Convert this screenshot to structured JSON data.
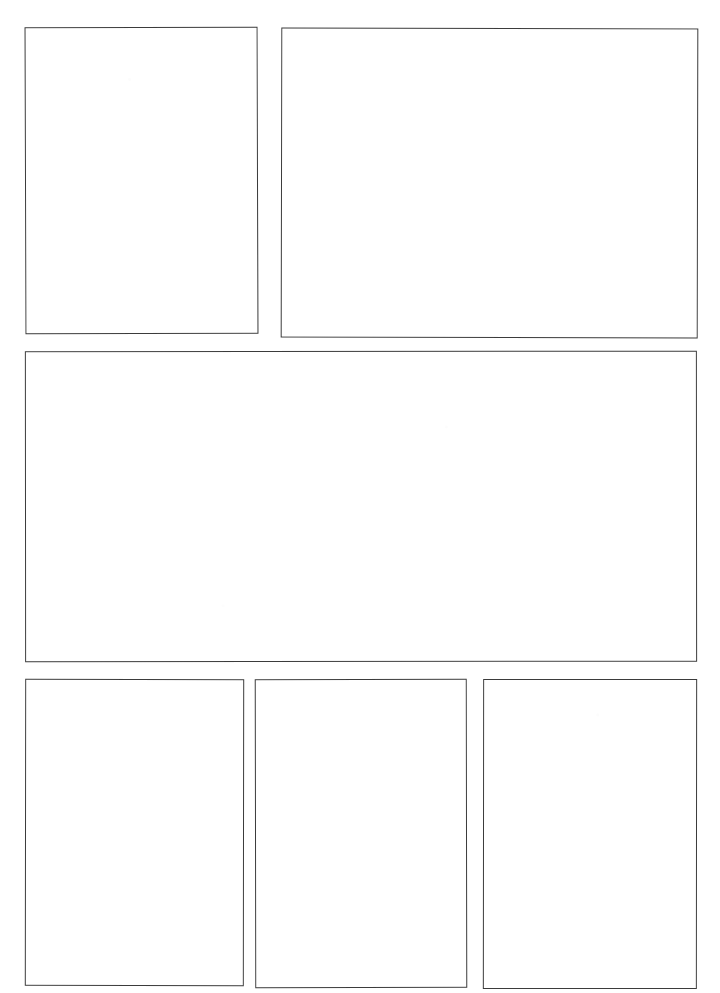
{
  "page": {
    "kind": "comic-page-layout",
    "width": 720,
    "height": 993,
    "background_color": "#ffffff",
    "ink_color": "#3b3b3b",
    "panel_count": 6,
    "row_count": 3,
    "content_text": ""
  },
  "rows": [
    {
      "name": "row-1",
      "label": "Top row",
      "panel_count": 2
    },
    {
      "name": "row-2",
      "label": "Middle row",
      "panel_count": 1
    },
    {
      "name": "row-3",
      "label": "Bottom row",
      "panel_count": 3
    }
  ],
  "panels": [
    {
      "id": "panel-1",
      "label": "Panel 1",
      "row": 1,
      "index_in_row": 1,
      "content_text": "",
      "x": 25,
      "y": 27,
      "width": 233,
      "height": 307,
      "border_width": 1.6,
      "rotate": -0.18
    },
    {
      "id": "panel-2",
      "label": "Panel 2",
      "row": 1,
      "index_in_row": 2,
      "content_text": "",
      "x": 281,
      "y": 28,
      "width": 417,
      "height": 310,
      "border_width": 1.6,
      "rotate": 0.12
    },
    {
      "id": "panel-3",
      "label": "Panel 3",
      "row": 2,
      "index_in_row": 1,
      "content_text": "",
      "x": 25,
      "y": 351,
      "width": 672,
      "height": 311,
      "border_width": 1.6,
      "rotate": -0.05
    },
    {
      "id": "panel-4",
      "label": "Panel 4",
      "row": 3,
      "index_in_row": 1,
      "content_text": "",
      "x": 25,
      "y": 679,
      "width": 219,
      "height": 307,
      "border_width": 1.6,
      "rotate": 0.08
    },
    {
      "id": "panel-5",
      "label": "Panel 5",
      "row": 3,
      "index_in_row": 2,
      "content_text": "",
      "x": 255,
      "y": 679,
      "width": 212,
      "height": 309,
      "border_width": 1.6,
      "rotate": -0.1
    },
    {
      "id": "panel-6",
      "label": "Panel 6",
      "row": 3,
      "index_in_row": 3,
      "content_text": "",
      "x": 483,
      "y": 679,
      "width": 214,
      "height": 310,
      "border_width": 1.6,
      "rotate": 0.06
    }
  ]
}
